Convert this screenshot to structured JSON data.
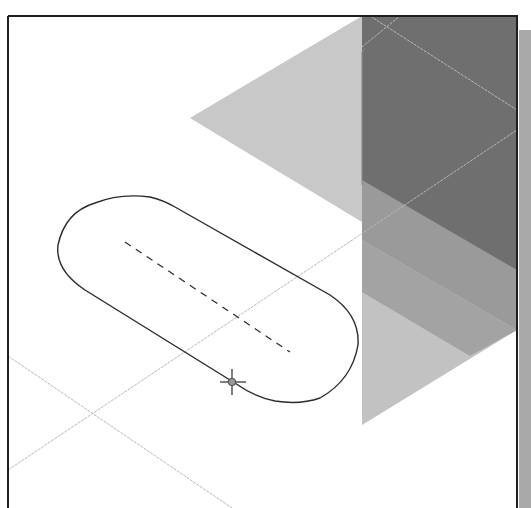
{
  "viewport": {
    "type": "cad-sketch-view",
    "frame": {
      "left": 8,
      "top": 16,
      "right": 517,
      "bottom": 508
    },
    "colors": {
      "background": "#ffffff",
      "frame": "#1e1e1e",
      "plane_light": "#c6c6c6",
      "plane_mid": "#a8a8a8",
      "plane_dark": "#6e6e6e",
      "plane_edge": "#d8d8d8",
      "sketch_line": "#2a2a2a",
      "centerline": "#2a2a2a",
      "construction_line": "#b5b5b5",
      "side_strip": "#a9a9a9"
    }
  },
  "planes": [
    {
      "name": "front-plane",
      "points": "190,118 362,16 362,222"
    },
    {
      "name": "top-plane-dark",
      "points": "362,16 517,16 517,330 362,240"
    },
    {
      "name": "right-plane-light",
      "points": "362,240 517,330 362,425"
    }
  ],
  "sketch": {
    "slot": {
      "path": "M 120 197 L 296 300 A 54 54 0 0 1 296 402 L 282 402 A 0 0 0 0 1 282 402 L 232 380 L 90 297 A 54 54 0 0 1 120 197 Z"
    },
    "centerline": {
      "x1": 125,
      "y1": 242,
      "x2": 290,
      "y2": 352
    },
    "cursor_point": {
      "x": 232,
      "y": 381
    }
  },
  "construction_lines": [
    {
      "x1": 8,
      "y1": 470,
      "x2": 517,
      "y2": 130
    },
    {
      "x1": 8,
      "y1": 356,
      "x2": 232,
      "y2": 508
    },
    {
      "x1": 370,
      "y1": 16,
      "x2": 517,
      "y2": 110
    },
    {
      "x1": 362,
      "y1": 47,
      "x2": 400,
      "y2": 16
    }
  ]
}
